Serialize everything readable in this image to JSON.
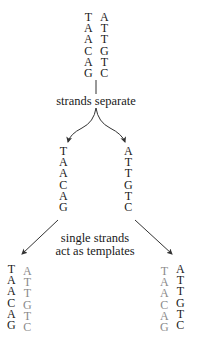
{
  "diagram": {
    "top_duplex": {
      "left_strand": [
        "T",
        "A",
        "A",
        "C",
        "A",
        "G"
      ],
      "right_strand": [
        "A",
        "T",
        "T",
        "G",
        "T",
        "C"
      ]
    },
    "step1_label": "strands separate",
    "separated": {
      "left_strand": [
        "T",
        "A",
        "A",
        "C",
        "A",
        "G"
      ],
      "right_strand": [
        "A",
        "T",
        "T",
        "G",
        "T",
        "C"
      ]
    },
    "step2_label_line1": "single strands",
    "step2_label_line2": "act as templates",
    "bottom_left_duplex": {
      "template_strand": [
        "T",
        "A",
        "A",
        "C",
        "A",
        "G"
      ],
      "new_strand": [
        "A",
        "T",
        "T",
        "G",
        "T",
        "C"
      ]
    },
    "bottom_right_duplex": {
      "new_strand": [
        "T",
        "A",
        "A",
        "C",
        "A",
        "G"
      ],
      "template_strand": [
        "A",
        "T",
        "T",
        "G",
        "T",
        "C"
      ]
    },
    "colors": {
      "template_strand": "#1a1a1a",
      "new_strand": "#8a8a8a",
      "lines": "#333333"
    }
  }
}
